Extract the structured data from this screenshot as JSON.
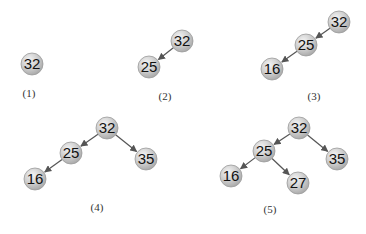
{
  "colors": {
    "node_fill": "#c9c9c9",
    "node_highlight": "#f2f2f2",
    "node_stroke": "#9a9a9a",
    "edge": "#555555",
    "text": "#111111"
  },
  "steps": [
    {
      "label": "(1)",
      "label_pos": [
        29,
        97
      ],
      "nodes": [
        {
          "id": "n1_32",
          "value": "32",
          "x": 32,
          "y": 64
        }
      ],
      "edges": []
    },
    {
      "label": "(2)",
      "label_pos": [
        165,
        100
      ],
      "nodes": [
        {
          "id": "n2_32",
          "value": "32",
          "x": 182,
          "y": 41
        },
        {
          "id": "n2_25",
          "value": "25",
          "x": 149,
          "y": 67
        }
      ],
      "edges": [
        {
          "from": "n2_32",
          "to": "n2_25"
        }
      ]
    },
    {
      "label": "(3)",
      "label_pos": [
        314,
        100
      ],
      "nodes": [
        {
          "id": "n3_32",
          "value": "32",
          "x": 339,
          "y": 22
        },
        {
          "id": "n3_25",
          "value": "25",
          "x": 306,
          "y": 45
        },
        {
          "id": "n3_16",
          "value": "16",
          "x": 272,
          "y": 69
        }
      ],
      "edges": [
        {
          "from": "n3_32",
          "to": "n3_25"
        },
        {
          "from": "n3_25",
          "to": "n3_16"
        }
      ]
    },
    {
      "label": "(4)",
      "label_pos": [
        97,
        211
      ],
      "nodes": [
        {
          "id": "n4_32",
          "value": "32",
          "x": 107,
          "y": 128
        },
        {
          "id": "n4_25",
          "value": "25",
          "x": 71,
          "y": 153
        },
        {
          "id": "n4_35",
          "value": "35",
          "x": 146,
          "y": 159
        },
        {
          "id": "n4_16",
          "value": "16",
          "x": 35,
          "y": 179
        }
      ],
      "edges": [
        {
          "from": "n4_32",
          "to": "n4_25"
        },
        {
          "from": "n4_32",
          "to": "n4_35"
        },
        {
          "from": "n4_25",
          "to": "n4_16"
        }
      ]
    },
    {
      "label": "(5)",
      "label_pos": [
        270,
        213
      ],
      "nodes": [
        {
          "id": "n5_32",
          "value": "32",
          "x": 299,
          "y": 128
        },
        {
          "id": "n5_25",
          "value": "25",
          "x": 264,
          "y": 151
        },
        {
          "id": "n5_35",
          "value": "35",
          "x": 337,
          "y": 159
        },
        {
          "id": "n5_16",
          "value": "16",
          "x": 231,
          "y": 176
        },
        {
          "id": "n5_27",
          "value": "27",
          "x": 298,
          "y": 183
        }
      ],
      "edges": [
        {
          "from": "n5_32",
          "to": "n5_25"
        },
        {
          "from": "n5_32",
          "to": "n5_35"
        },
        {
          "from": "n5_25",
          "to": "n5_16"
        },
        {
          "from": "n5_25",
          "to": "n5_27"
        }
      ]
    }
  ]
}
